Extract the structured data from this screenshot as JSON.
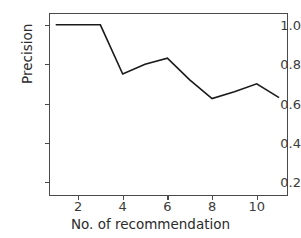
{
  "chart_data": {
    "type": "line",
    "title": "",
    "subtitle": "",
    "xlabel": "No. of recommendation",
    "ylabel": "Precision",
    "x": [
      1,
      2,
      3,
      4,
      5,
      6,
      7,
      8,
      9,
      10,
      11
    ],
    "values": [
      1.0,
      1.0,
      1.0,
      0.75,
      0.8,
      0.83,
      0.72,
      0.625,
      0.66,
      0.7,
      0.63
    ],
    "series": [
      {
        "name": "Precision",
        "values": [
          1.0,
          1.0,
          1.0,
          0.75,
          0.8,
          0.83,
          0.72,
          0.625,
          0.66,
          0.7,
          0.63
        ]
      }
    ],
    "xlim": [
      0.7,
      11.4
    ],
    "ylim": [
      0.13,
      1.06
    ],
    "xticks": [
      2,
      4,
      6,
      8,
      10
    ],
    "yticks": [
      0.2,
      0.4,
      0.6,
      0.8,
      1.0
    ],
    "xtick_labels": [
      "2",
      "4",
      "6",
      "8",
      "10"
    ],
    "ytick_labels": [
      "0.2",
      "0.4",
      "0.6",
      "0.8",
      "1.0"
    ],
    "grid": false,
    "legend": false,
    "legend_position": "none",
    "line_color": "#1a1a1a",
    "line_width": 1.6,
    "marker": "none",
    "frame_color": "#4a4a4a",
    "background": "#ffffff",
    "annotations": []
  },
  "axes": {
    "x_label_text": "No. of recommendation",
    "y_label_text": "Precision"
  }
}
